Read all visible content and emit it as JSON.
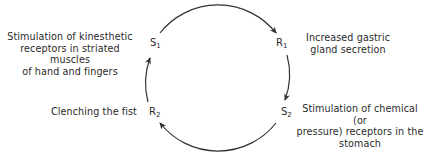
{
  "diagram": {
    "type": "cycle",
    "nodes": [
      {
        "id": "S1",
        "letter": "S",
        "sub": "1",
        "description": "Stimulation of kinesthetic receptors in striated muscles of hand and fingers",
        "lines": [
          "Stimulation of kinesthetic",
          "receptors in striated muscles",
          "of hand and fingers"
        ]
      },
      {
        "id": "R1",
        "letter": "R",
        "sub": "1",
        "description": "Increased gastric gland secretion",
        "lines": [
          "Increased gastric",
          "gland secretion"
        ]
      },
      {
        "id": "S2",
        "letter": "S",
        "sub": "2",
        "description": "Stimulation of chemical (or pressure) receptors in the stomach",
        "lines": [
          "Stimulation of chemical (or",
          "pressure) receptors in the",
          "stomach"
        ]
      },
      {
        "id": "R2",
        "letter": "R",
        "sub": "2",
        "description": "Clenching the fist",
        "lines": [
          "Clenching the fist"
        ]
      }
    ],
    "edges": [
      {
        "from": "S1",
        "to": "R1"
      },
      {
        "from": "R1",
        "to": "S2"
      },
      {
        "from": "S2",
        "to": "R2"
      },
      {
        "from": "R2",
        "to": "S1"
      }
    ],
    "colors": {
      "line": "#333333",
      "text": "#2a2a2a"
    }
  }
}
